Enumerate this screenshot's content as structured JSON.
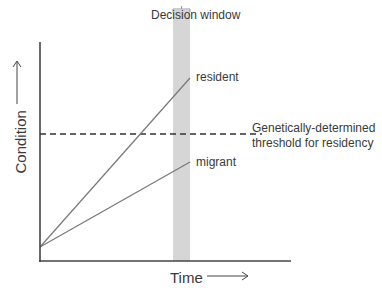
{
  "diagram": {
    "decision_window_label": "Decision window",
    "x_axis_label": "Time",
    "y_axis_label": "Condition",
    "x_arrow": "⟶",
    "y_arrow": "⟶",
    "lines": {
      "resident": {
        "label": "resident",
        "start": [
          40,
          247
        ],
        "end": [
          190,
          78
        ]
      },
      "migrant": {
        "label": "migrant",
        "start": [
          40,
          247
        ],
        "end": [
          190,
          162
        ]
      }
    },
    "threshold": {
      "line1": "Genetically-determined",
      "line2": "threshold for residency",
      "y": 134
    },
    "colors": {
      "axis": "#444444",
      "lines": "#6e6e6e",
      "decision_window": "#d4d4d4",
      "dashed": "#333333"
    }
  }
}
